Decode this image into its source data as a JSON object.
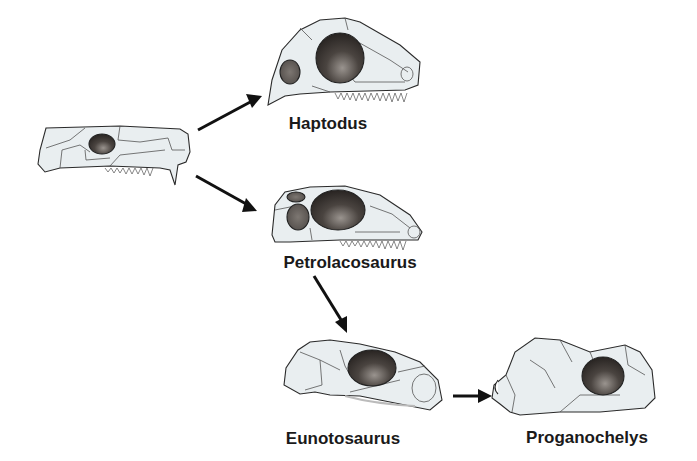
{
  "diagram": {
    "type": "evolutionary-tree",
    "colors": {
      "skull_fill": "#e9eef0",
      "outline": "#2a2a2a",
      "suture": "#4a4a4a",
      "fenestra_dark": "#2b2624",
      "fenestra_light": "#8a8480",
      "arrow": "#111111"
    },
    "taxa": [
      {
        "id": "limnoscelis",
        "label": "Limnoscelis"
      },
      {
        "id": "haptodus",
        "label": "Haptodus"
      },
      {
        "id": "petrolacosaurus",
        "label": "Petrolacosaurus"
      },
      {
        "id": "eunotosaurus",
        "label": "Eunotosaurus"
      },
      {
        "id": "proganochelys",
        "label": "Proganochelys"
      }
    ],
    "edges": [
      {
        "from": "Limnoscelis",
        "to": "Haptodus"
      },
      {
        "from": "Limnoscelis",
        "to": "Petrolacosaurus"
      },
      {
        "from": "Petrolacosaurus",
        "to": "Eunotosaurus"
      },
      {
        "from": "Eunotosaurus",
        "to": "Proganochelys"
      }
    ]
  }
}
